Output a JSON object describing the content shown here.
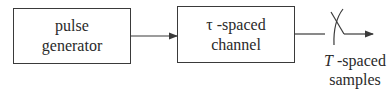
{
  "diagram": {
    "blocks": [
      {
        "id": "pulse-generator",
        "lines": [
          "pulse",
          "generator"
        ]
      },
      {
        "id": "channel",
        "symbol": "τ",
        "line1_suffix": " -spaced",
        "line2": "channel"
      }
    ],
    "output_label": {
      "symbol": "T",
      "line1_suffix": " -spaced",
      "line2": "samples"
    },
    "connections": [
      {
        "from": "pulse-generator",
        "to": "channel",
        "arrow": true
      },
      {
        "from": "channel",
        "to": "sampler-switch",
        "arrow": false
      },
      {
        "from": "sampler-switch",
        "to": "output",
        "arrow": true
      }
    ],
    "colors": {
      "stroke": "#3a3a3a",
      "background": "#ffffff",
      "text": "#2a2a2a"
    }
  }
}
